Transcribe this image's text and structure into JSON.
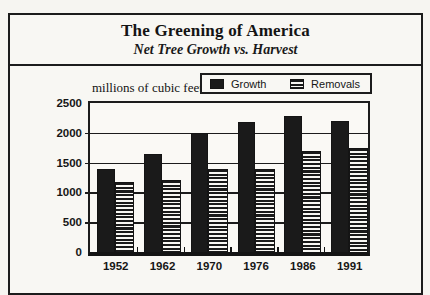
{
  "header": {
    "title": "The Greening of America",
    "subtitle": "Net Tree Growth vs. Harvest"
  },
  "legend": {
    "items": [
      {
        "label": "Growth",
        "style": "solid"
      },
      {
        "label": "Removals",
        "style": "striped"
      }
    ]
  },
  "colors": {
    "ink": "#1a1a1a",
    "paper": "#f8f7f3"
  },
  "chart_data": {
    "type": "bar",
    "title": "The Greening of America",
    "subtitle": "Net Tree Growth vs. Harvest",
    "ylabel": "millions of cubic feet",
    "xlabel": "",
    "categories": [
      "1952",
      "1962",
      "1970",
      "1976",
      "1986",
      "1991"
    ],
    "series": [
      {
        "name": "Growth",
        "style": "solid",
        "values": [
          1400,
          1650,
          2000,
          2175,
          2275,
          2200
        ]
      },
      {
        "name": "Removals",
        "style": "striped",
        "values": [
          1175,
          1200,
          1400,
          1400,
          1700,
          1750
        ]
      }
    ],
    "ylim": [
      0,
      2500
    ],
    "yticks": [
      0,
      500,
      1000,
      1500,
      2000,
      2500
    ],
    "grid": true,
    "legend_position": "top-right"
  }
}
